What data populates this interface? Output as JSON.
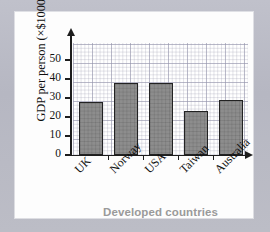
{
  "chart_data": {
    "type": "bar",
    "title": "",
    "categories": [
      "UK",
      "Norway",
      "USA",
      "Taiwan",
      "Australia"
    ],
    "values": [
      28,
      38,
      38,
      23,
      29
    ],
    "xlabel": "Developed countries",
    "ylabel": "GDP per person (×$1000)",
    "ylim": [
      0,
      55
    ],
    "yticks": [
      0,
      10,
      20,
      30,
      40,
      50
    ],
    "ytick_labels": [
      "0",
      "10",
      "20",
      "30",
      "40",
      "50"
    ],
    "grid": true,
    "legend": false,
    "bar_color": "#8d8d8d",
    "bar_border_color": "#222222",
    "axis_color": "#1d1d1d",
    "xlabel_color": "#9a9a9a",
    "plot_background": "#ffffff",
    "card_background": "#fdfdfd",
    "page_background": "#b9bac4"
  }
}
